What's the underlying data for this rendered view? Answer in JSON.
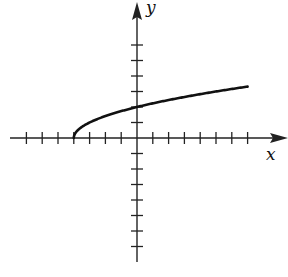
{
  "chart_data": {
    "type": "line",
    "title": "",
    "xlabel": "x",
    "ylabel": "y",
    "function": "y = sqrt(x + 4)",
    "xlim": [
      -8,
      9
    ],
    "ylim": [
      -8,
      7
    ],
    "x_ticks": [
      -7,
      -6,
      -5,
      -4,
      -3,
      -2,
      -1,
      1,
      2,
      3,
      4,
      5,
      6,
      7
    ],
    "y_ticks": [
      -7,
      -6,
      -5,
      -4,
      -3,
      -2,
      -1,
      1,
      2,
      3,
      4,
      5,
      6
    ],
    "tick_labels_shown": false,
    "grid": false,
    "series": [
      {
        "name": "curve",
        "x": [
          -4,
          -3.5,
          -3,
          -2,
          -1,
          0,
          1,
          2,
          3,
          4,
          5,
          6,
          7
        ],
        "values": [
          0,
          0.71,
          1,
          1.41,
          1.73,
          2,
          2.24,
          2.45,
          2.65,
          2.83,
          3,
          3.16,
          3.32
        ],
        "color": "#111111"
      }
    ],
    "start_point": [
      -4,
      0
    ],
    "y_intercept": 2
  },
  "labels": {
    "x": "x",
    "y": "y"
  }
}
